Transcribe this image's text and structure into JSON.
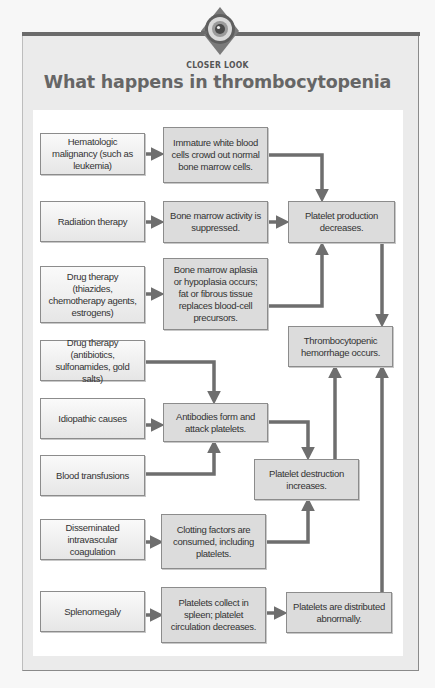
{
  "header": {
    "badge_icon": "eye-lens-icon",
    "kicker": "CLOSER LOOK",
    "title": "What happens in thrombocytopenia"
  },
  "colors": {
    "arrow": "#6e6e6e",
    "box_fill": "#dcdcdc",
    "panel": "#ebebeb",
    "title": "#666666"
  },
  "causes": [
    {
      "id": "hematologic",
      "label": "Hematologic malignancy (such as leukemia)"
    },
    {
      "id": "radiation",
      "label": "Radiation therapy"
    },
    {
      "id": "drug-thiazides",
      "label": "Drug therapy (thiazides, chemotherapy agents, estrogens)"
    },
    {
      "id": "drug-antibiotics",
      "label": "Drug therapy (antibiotics, sulfonamides, gold salts)"
    },
    {
      "id": "idiopathic",
      "label": "Idiopathic causes"
    },
    {
      "id": "transfusions",
      "label": "Blood transfusions"
    },
    {
      "id": "dic",
      "label": "Disseminated intravascular coagulation"
    },
    {
      "id": "splenomegaly",
      "label": "Splenomegaly"
    }
  ],
  "mechanisms": [
    {
      "id": "immature-wbc",
      "label": "Immature white blood cells crowd out normal bone marrow cells."
    },
    {
      "id": "marrow-suppressed",
      "label": "Bone marrow activity is suppressed."
    },
    {
      "id": "aplasia",
      "label": "Bone marrow aplasia or hypoplasia occurs; fat or fibrous tissue replaces blood-cell precursors."
    },
    {
      "id": "antibodies",
      "label": "Antibodies form and attack platelets."
    },
    {
      "id": "clotting",
      "label": "Clotting factors are consumed, including platelets."
    },
    {
      "id": "spleen-collect",
      "label": "Platelets collect in spleen; platelet circulation decreases."
    }
  ],
  "outcomes": [
    {
      "id": "production-decreases",
      "label": "Platelet production decreases."
    },
    {
      "id": "hemorrhage",
      "label": "Thrombocytopenic hemorrhage occurs."
    },
    {
      "id": "destruction-increases",
      "label": "Platelet destruction increases."
    },
    {
      "id": "distributed-abnormally",
      "label": "Platelets are distributed abnormally."
    }
  ],
  "edges": [
    [
      "hematologic",
      "immature-wbc"
    ],
    [
      "immature-wbc",
      "production-decreases"
    ],
    [
      "radiation",
      "marrow-suppressed"
    ],
    [
      "marrow-suppressed",
      "production-decreases"
    ],
    [
      "drug-thiazides",
      "aplasia"
    ],
    [
      "aplasia",
      "production-decreases"
    ],
    [
      "production-decreases",
      "hemorrhage"
    ],
    [
      "drug-antibiotics",
      "antibodies"
    ],
    [
      "idiopathic",
      "antibodies"
    ],
    [
      "transfusions",
      "antibodies"
    ],
    [
      "antibodies",
      "destruction-increases"
    ],
    [
      "dic",
      "clotting"
    ],
    [
      "clotting",
      "destruction-increases"
    ],
    [
      "destruction-increases",
      "hemorrhage"
    ],
    [
      "splenomegaly",
      "spleen-collect"
    ],
    [
      "spleen-collect",
      "distributed-abnormally"
    ],
    [
      "distributed-abnormally",
      "hemorrhage"
    ]
  ]
}
